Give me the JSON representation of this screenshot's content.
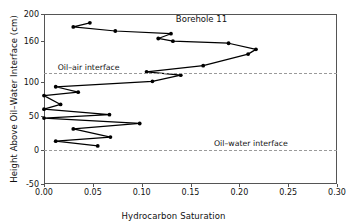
{
  "chart_data": {
    "type": "line",
    "title": "Borehole 11",
    "xlabel": "Hydrocarbon Saturation",
    "ylabel": "Height Above Oil–Water Interface (cm)",
    "xlim": [
      0.0,
      0.3
    ],
    "ylim": [
      -50,
      200
    ],
    "xticks": [
      0.0,
      0.05,
      0.1,
      0.15,
      0.2,
      0.25,
      0.3
    ],
    "xtick_labels": [
      "0.00",
      "0.05",
      "0.10",
      "0.15",
      "0.20",
      "0.25",
      "0.30"
    ],
    "yticks": [
      200,
      160,
      100,
      50,
      0,
      -50
    ],
    "ytick_labels": [
      "200",
      "160",
      "100",
      "50",
      "0",
      "-50"
    ],
    "grid": false,
    "legend": null,
    "marker": "filled-circle",
    "line_color": "#000000",
    "series": [
      {
        "name": "Hydrocarbon saturation profile",
        "x": [
          0.047,
          0.03,
          0.073,
          0.13,
          0.117,
          0.132,
          0.189,
          0.217,
          0.209,
          0.163,
          0.105,
          0.14,
          0.111,
          0.012,
          0.035,
          0.0,
          0.017,
          0.0,
          0.067,
          0.0,
          0.098,
          0.03,
          0.068,
          0.012,
          0.055
        ],
        "y": [
          187,
          181,
          175,
          171,
          164,
          160,
          157,
          148,
          141,
          124,
          115,
          110,
          101,
          93,
          85,
          80,
          67,
          60,
          52,
          47,
          39,
          31,
          19,
          13,
          6
        ]
      }
    ],
    "annotations": [
      {
        "name": "oil-air-interface",
        "label": "Oil–air interface",
        "y": 113,
        "style": "dashed-hline"
      },
      {
        "name": "oil-water-interface",
        "label": "Oil–water interface",
        "y": 0,
        "style": "dashed-hline"
      }
    ],
    "colors": {
      "axis": "#555555",
      "interface": "#9a9a9a",
      "data": "#000000"
    }
  }
}
